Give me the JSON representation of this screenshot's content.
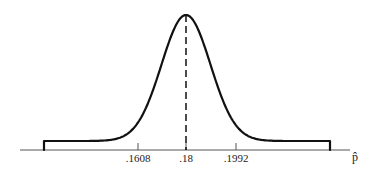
{
  "chart_data": {
    "type": "line",
    "title": "",
    "subtitle": "Sampling distribution of p-hat (normal curve)",
    "xlabel": "p̂",
    "ylabel": "",
    "grid": false,
    "legend": null,
    "distribution": {
      "kind": "normal",
      "mean": 0.18,
      "std_dev": 0.0096,
      "marked_values": [
        0.1608,
        0.18,
        0.1992
      ]
    },
    "tick_labels": [
      ".1608",
      ".18",
      ".1992"
    ],
    "x": [
      0.1608,
      0.18,
      0.1992
    ],
    "annotations": [
      {
        "type": "dashed-vertical-line",
        "at": 0.18,
        "label": "mean"
      }
    ],
    "xlim": [
      0.1412,
      0.2188
    ]
  },
  "axis": {
    "variable_label": "p̂",
    "ticks": [
      {
        "label": ".1608",
        "value": 0.1608
      },
      {
        "label": ".18",
        "value": 0.18
      },
      {
        "label": ".1992",
        "value": 0.1992
      }
    ]
  },
  "colors": {
    "curve": "#111111",
    "axis": "#444444",
    "background": "#ffffff"
  }
}
